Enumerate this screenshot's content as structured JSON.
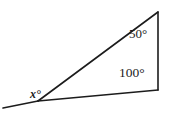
{
  "figure": {
    "type": "triangle-angle-diagram",
    "background_color": "#ffffff",
    "stroke_color": "#1c1c1c",
    "stroke_width": 1.6,
    "canvas": {
      "width": 169,
      "height": 114
    },
    "vertices": {
      "apex": {
        "name": "apex-vertex",
        "x": 158,
        "y": 12
      },
      "base_right": {
        "name": "base-right-vertex",
        "x": 158,
        "y": 90
      },
      "base_left": {
        "name": "base-left-vertex",
        "x": 38,
        "y": 101
      },
      "ray_end_left": {
        "name": "extended-ray-endpoint",
        "x": 3,
        "y": 108
      }
    },
    "segments": [
      {
        "name": "hypotenuse",
        "from": "apex",
        "to": "base_left"
      },
      {
        "name": "right-vertical-side",
        "from": "apex",
        "to": "base_right"
      },
      {
        "name": "base-side",
        "from": "base_right",
        "to": "base_left"
      },
      {
        "name": "extended-base-ray",
        "from": "base_left",
        "to": "ray_end_left"
      }
    ],
    "labels": {
      "apex_angle": "50°",
      "base_right_angle": "100°",
      "base_left_angle": "x°"
    }
  },
  "chart_data": {
    "type": "diagram",
    "title": "",
    "angles": [
      {
        "vertex": "apex",
        "label": "50°",
        "value": 50,
        "unit": "degrees"
      },
      {
        "vertex": "base_right",
        "label": "100°",
        "value": 100,
        "unit": "degrees"
      },
      {
        "vertex": "base_left",
        "label": "x°",
        "value": null,
        "unit": "degrees"
      }
    ]
  }
}
